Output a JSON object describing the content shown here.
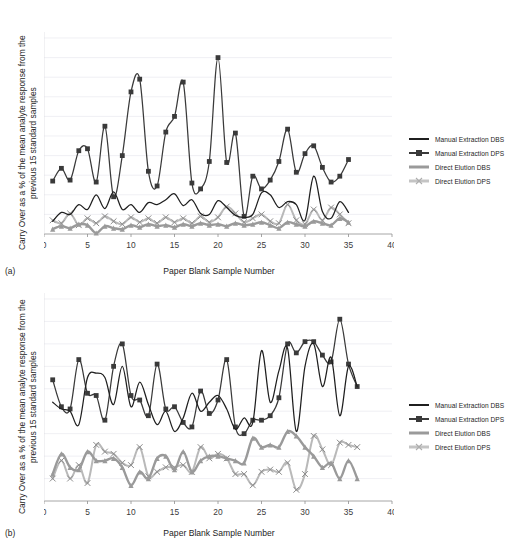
{
  "header": {
    "running_head": ""
  },
  "common": {
    "ylabel": "Carry Over as a % of the mean analyte response from the previous 15 standard samples",
    "xlabel": "Paper Blank Sample Number",
    "legend": [
      {
        "name": "Manual Extraction DBS",
        "style": "line-dark",
        "color": "#1f1f1f"
      },
      {
        "name": "Manual Extraction DPS",
        "style": "line-dark-square",
        "color": "#3a3a3a"
      },
      {
        "name": "Direct Elution DBS",
        "style": "line-grey",
        "color": "#9a9a9a"
      },
      {
        "name": "Direct Elution DPS",
        "style": "line-lightgrey-x",
        "color": "#c4c4c4"
      }
    ]
  },
  "panel_a": {
    "label": "(a)"
  },
  "panel_b": {
    "label": "(b)"
  },
  "chart_data": [
    {
      "id": "a",
      "type": "line",
      "title": "",
      "panel_label": "(a)",
      "xlabel": "Paper Blank Sample Number",
      "ylabel": "Carry Over as a % of the mean analyte response from the previous 15 standard samples",
      "xlim": [
        0,
        40
      ],
      "ylim": [
        0,
        2
      ],
      "xticks": [
        0,
        5,
        10,
        15,
        20,
        25,
        30,
        35,
        40
      ],
      "yticks": [
        0,
        0.2,
        0.4,
        0.6,
        0.8,
        1,
        1.2,
        1.4,
        1.6,
        1.8,
        2
      ],
      "grid": "horizontal",
      "legend_position": "right",
      "x": [
        1,
        2,
        3,
        4,
        5,
        6,
        7,
        8,
        9,
        10,
        11,
        12,
        13,
        14,
        15,
        16,
        17,
        18,
        19,
        20,
        21,
        22,
        23,
        24,
        25,
        26,
        27,
        28,
        29,
        30,
        31,
        32,
        33,
        34,
        35
      ],
      "series": [
        {
          "name": "Manual Extraction DBS",
          "marker": "none",
          "color": "#1f1f1f",
          "values": [
            0.13,
            0.22,
            0.2,
            0.3,
            0.25,
            0.4,
            0.26,
            0.43,
            0.25,
            0.3,
            0.22,
            0.32,
            0.3,
            0.35,
            0.41,
            0.29,
            0.35,
            0.21,
            0.2,
            0.34,
            0.27,
            0.19,
            0.17,
            0.2,
            0.42,
            0.4,
            0.27,
            0.33,
            0.3,
            0.14,
            0.59,
            0.23,
            0.16,
            0.33,
            0.22
          ]
        },
        {
          "name": "Manual Extraction DPS",
          "marker": "square",
          "color": "#3a3a3a",
          "values": [
            0.54,
            0.67,
            0.55,
            0.85,
            0.87,
            0.53,
            1.1,
            0.38,
            0.8,
            1.45,
            1.58,
            0.64,
            0.49,
            1.04,
            1.2,
            1.55,
            0.52,
            0.46,
            0.74,
            1.8,
            0.73,
            1.03,
            0.18,
            0.59,
            0.46,
            0.55,
            0.74,
            1.07,
            0.63,
            0.82,
            0.9,
            0.68,
            0.53,
            0.59,
            0.76
          ]
        },
        {
          "name": "Direct Elution DBS",
          "marker": "triangle",
          "color": "#9a9a9a",
          "values": [
            0.05,
            0.08,
            0.06,
            0.1,
            0.09,
            0.01,
            0.08,
            0.06,
            0.05,
            0.09,
            0.07,
            0.1,
            0.08,
            0.09,
            0.07,
            0.1,
            0.08,
            0.11,
            0.09,
            0.1,
            0.08,
            0.11,
            0.09,
            0.1,
            0.12,
            0.09,
            0.06,
            0.12,
            0.1,
            0.08,
            0.13,
            0.11,
            0.09,
            0.16,
            0.12
          ]
        },
        {
          "name": "Direct Elution DPS",
          "marker": "x",
          "color": "#b9b9b9",
          "values": [
            0.14,
            0.11,
            0.21,
            0.09,
            0.16,
            0.11,
            0.18,
            0.13,
            0.1,
            0.17,
            0.12,
            0.16,
            0.11,
            0.17,
            0.12,
            0.16,
            0.11,
            0.18,
            0.12,
            0.17,
            0.28,
            0.21,
            0.12,
            0.16,
            0.2,
            0.13,
            0.11,
            0.3,
            0.14,
            0.1,
            0.25,
            0.14,
            0.27,
            0.2,
            0.11
          ]
        }
      ]
    },
    {
      "id": "b",
      "type": "line",
      "title": "",
      "panel_label": "(b)",
      "xlabel": "Paper Blank Sample Number",
      "ylabel": "Carry Over as a % of the mean analyte response from the previous 15 standard samples",
      "xlim": [
        0,
        40
      ],
      "ylim": [
        0,
        0.9
      ],
      "xticks": [
        0,
        5,
        10,
        15,
        20,
        25,
        30,
        35,
        40
      ],
      "yticks": [
        0,
        0.1,
        0.2,
        0.3,
        0.4,
        0.5,
        0.6,
        0.7,
        0.8,
        0.9
      ],
      "grid": "horizontal",
      "legend_position": "right",
      "x": [
        1,
        2,
        3,
        4,
        5,
        6,
        7,
        8,
        9,
        10,
        11,
        12,
        13,
        14,
        15,
        16,
        17,
        18,
        19,
        20,
        21,
        22,
        23,
        24,
        25,
        26,
        27,
        28,
        29,
        30,
        31,
        32,
        33,
        34,
        35,
        36
      ],
      "series": [
        {
          "name": "Manual Extraction DBS",
          "marker": "none",
          "color": "#1f1f1f",
          "values": [
            0.44,
            0.41,
            0.4,
            0.34,
            0.55,
            0.57,
            0.55,
            0.43,
            0.6,
            0.42,
            0.53,
            0.43,
            0.34,
            0.4,
            0.31,
            0.37,
            0.48,
            0.4,
            0.44,
            0.47,
            0.41,
            0.32,
            0.37,
            0.35,
            0.67,
            0.44,
            0.58,
            0.68,
            0.31,
            0.6,
            0.7,
            0.51,
            0.64,
            0.38,
            0.6,
            0.51
          ]
        },
        {
          "name": "Manual Extraction DPS",
          "marker": "square",
          "color": "#3a3a3a",
          "values": [
            0.54,
            0.42,
            0.41,
            0.63,
            0.48,
            0.47,
            0.36,
            0.6,
            0.7,
            0.47,
            0.45,
            0.38,
            0.61,
            0.41,
            0.42,
            0.35,
            0.33,
            0.49,
            0.39,
            0.45,
            0.63,
            0.33,
            0.3,
            0.36,
            0.36,
            0.38,
            0.46,
            0.7,
            0.66,
            0.71,
            0.71,
            0.65,
            0.62,
            0.81,
            0.61,
            0.51
          ]
        },
        {
          "name": "Direct Elution DBS",
          "marker": "triangle",
          "color": "#9a9a9a",
          "values": [
            0.12,
            0.21,
            0.15,
            0.14,
            0.22,
            0.18,
            0.18,
            0.19,
            0.15,
            0.07,
            0.13,
            0.1,
            0.19,
            0.2,
            0.14,
            0.22,
            0.13,
            0.18,
            0.2,
            0.2,
            0.19,
            0.18,
            0.17,
            0.28,
            0.24,
            0.25,
            0.24,
            0.31,
            0.29,
            0.24,
            0.2,
            0.15,
            0.17,
            0.1,
            0.18,
            0.1
          ]
        },
        {
          "name": "Direct Elution DPS",
          "marker": "x",
          "color": "#b9b9b9",
          "values": [
            0.1,
            0.18,
            0.1,
            0.16,
            0.08,
            0.25,
            0.22,
            0.21,
            0.17,
            0.16,
            0.24,
            0.11,
            0.13,
            0.15,
            0.15,
            0.16,
            0.13,
            0.24,
            0.19,
            0.21,
            0.19,
            0.12,
            0.12,
            0.07,
            0.13,
            0.14,
            0.13,
            0.17,
            0.05,
            0.12,
            0.29,
            0.23,
            0.16,
            0.26,
            0.25,
            0.24
          ]
        }
      ]
    }
  ]
}
